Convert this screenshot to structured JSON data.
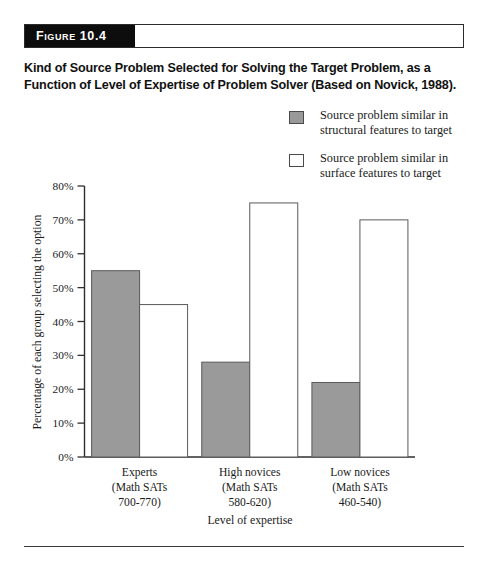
{
  "figure": {
    "tag": "Figure 10.4",
    "caption": "Kind of Source Problem Selected for Solving the Target Problem, as a Function of Level of Expertise of Problem Solver (Based on Novick, 1988)."
  },
  "legend": {
    "entries": [
      {
        "swatch": "gray-swatch-icon",
        "line1": "Source problem similar in",
        "line2": "structural features to target"
      },
      {
        "swatch": "white-swatch-icon",
        "line1": "Source problem similar in",
        "line2": "surface features to target"
      }
    ]
  },
  "colors": {
    "structural_fill": "#9a9a9a",
    "surface_fill": "#ffffff",
    "bar_stroke": "#5a5a5a",
    "axis": "#2f2f2f",
    "tag_background": "#0d0d0d",
    "tag_text": "#ffffff"
  },
  "chart_data": {
    "type": "bar",
    "title": "Kind of Source Problem Selected for Solving the Target Problem, as a Function of Level of Expertise of Problem Solver (Based on Novick, 1988).",
    "xlabel": "Level of expertise",
    "ylabel": "Percentage of each group selecting the option",
    "categories": [
      "Experts (Math SATs 700-770)",
      "High novices (Math SATs 580-620)",
      "Low novices (Math SATs 460-540)"
    ],
    "category_lines": [
      [
        "Experts",
        "(Math SATs",
        "700-770)"
      ],
      [
        "High novices",
        "(Math SATs",
        "580-620)"
      ],
      [
        "Low novices",
        "(Math SATs",
        "460-540)"
      ]
    ],
    "series": [
      {
        "name": "Source problem similar in structural features to target",
        "values": [
          55,
          28,
          22
        ]
      },
      {
        "name": "Source problem similar in surface features to target",
        "values": [
          45,
          75,
          70
        ]
      }
    ],
    "ylim": [
      0,
      80
    ],
    "ytick_step": 10,
    "ytick_labels": [
      "0%",
      "10%",
      "20%",
      "30%",
      "40%",
      "50%",
      "60%",
      "70%",
      "80%"
    ],
    "grid": false,
    "legend_position": "top-right"
  }
}
